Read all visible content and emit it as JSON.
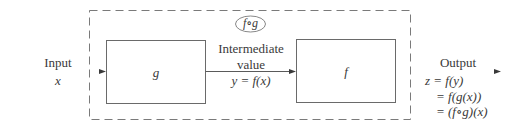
{
  "diagram": {
    "composite_label": "f∘g",
    "input": {
      "label": "Input",
      "variable": "x"
    },
    "box_g": {
      "label": "g"
    },
    "intermediate": {
      "line1": "Intermediate",
      "line2": "value",
      "equation": "y = f(x)"
    },
    "box_f": {
      "label": "f"
    },
    "output": {
      "label": "Output",
      "lines": [
        "z = f(y)",
        "= f(g(x))",
        "= (f∘g)(x)"
      ]
    },
    "colors": {
      "stroke": "#6a6a6a",
      "dashed": "#7a7a7a",
      "text": "#3a3a3a"
    }
  }
}
